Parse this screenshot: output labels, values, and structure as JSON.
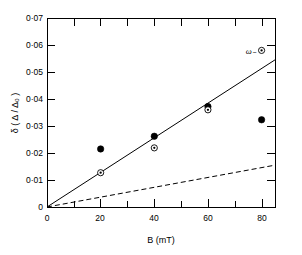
{
  "chart_data": {
    "type": "scatter",
    "title": "",
    "xlabel": "B (mT)",
    "ylabel": "δ ( Δ / Δ₀ )",
    "xlim": [
      0,
      85
    ],
    "ylim": [
      0,
      0.07
    ],
    "grid": false,
    "legend_position": "none",
    "x_ticks": [
      0,
      20,
      40,
      60,
      80
    ],
    "x_tick_labels": [
      "0",
      "20",
      "40",
      "60",
      "80"
    ],
    "x_minor_ticks": [
      10,
      30,
      50,
      70
    ],
    "y_ticks": [
      0,
      0.01,
      0.02,
      0.03,
      0.04,
      0.05,
      0.06,
      0.07
    ],
    "y_tick_labels": [
      "0",
      "0·01",
      "0·02",
      "0·03",
      "0·04",
      "0·05",
      "0·06",
      "0·07"
    ],
    "series": [
      {
        "name": "filled-circle",
        "marker": "filled-circle",
        "x": [
          20,
          40,
          60,
          80
        ],
        "y": [
          0.0215,
          0.0262,
          0.0372,
          0.0323
        ]
      },
      {
        "name": "circled-dot",
        "marker": "circle-dot",
        "x": [
          20,
          40,
          60,
          80
        ],
        "y": [
          0.0127,
          0.0219,
          0.036,
          0.058
        ]
      }
    ],
    "lines": [
      {
        "name": "omega-minus-fit",
        "style": "solid",
        "x": [
          0,
          85
        ],
        "y": [
          0,
          0.0545
        ],
        "label": "ω₋",
        "label_x": 76,
        "label_y": 0.0565
      },
      {
        "name": "lower-dashed-fit",
        "style": "dashed",
        "x": [
          0,
          85
        ],
        "y": [
          0,
          0.0155
        ],
        "label": ""
      }
    ]
  }
}
